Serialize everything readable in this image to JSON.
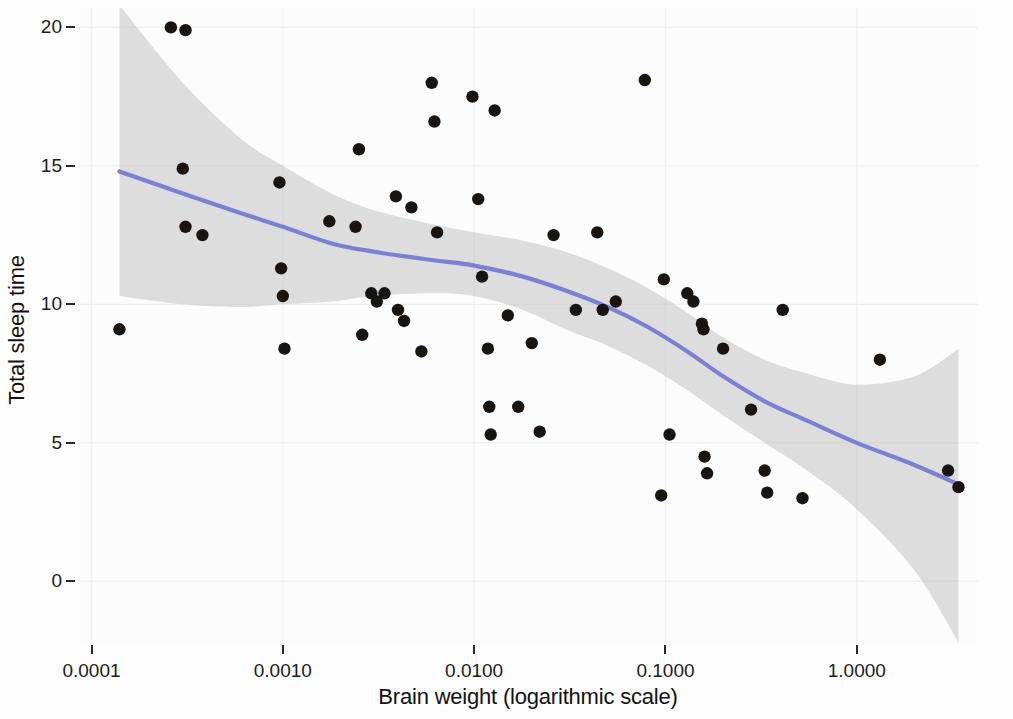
{
  "chart_data": {
    "type": "scatter",
    "title": "",
    "subtitle": "",
    "xlabel": "Brain weight (logarithmic scale)",
    "ylabel": "Total sleep time",
    "x_scale": "log10",
    "xtick_labels": [
      "0.0001",
      "0.0010",
      "0.0100",
      "0.1000",
      "1.0000"
    ],
    "xtick_values": [
      0.0001,
      0.001,
      0.01,
      0.1,
      1.0
    ],
    "ytick_labels": [
      "0",
      "5",
      "10",
      "15",
      "20"
    ],
    "ytick_values": [
      0,
      5,
      10,
      15,
      20
    ],
    "xlim": [
      8.5e-05,
      4.3
    ],
    "ylim": [
      -2.3,
      20.7
    ],
    "grid": true,
    "legend": null,
    "accent_color": "#7b80d4",
    "point_color": "#1a1411",
    "ribbon_color": "#bfbfbf",
    "panel_color": "#fcfcfc",
    "series": [
      {
        "name": "Mammal observations",
        "type": "scatter",
        "points": [
          {
            "x": 0.00014,
            "y": 9.1
          },
          {
            "x": 0.00026,
            "y": 20.0
          },
          {
            "x": 0.00031,
            "y": 19.9
          },
          {
            "x": 0.0003,
            "y": 14.9
          },
          {
            "x": 0.00031,
            "y": 12.8
          },
          {
            "x": 0.00038,
            "y": 12.5
          },
          {
            "x": 0.00096,
            "y": 14.4
          },
          {
            "x": 0.00098,
            "y": 11.3
          },
          {
            "x": 0.001,
            "y": 10.3
          },
          {
            "x": 0.00102,
            "y": 8.4
          },
          {
            "x": 0.00175,
            "y": 13.0
          },
          {
            "x": 0.0025,
            "y": 15.6
          },
          {
            "x": 0.0024,
            "y": 12.8
          },
          {
            "x": 0.0026,
            "y": 8.9
          },
          {
            "x": 0.0029,
            "y": 10.4
          },
          {
            "x": 0.0031,
            "y": 10.1
          },
          {
            "x": 0.0034,
            "y": 10.4
          },
          {
            "x": 0.0039,
            "y": 13.9
          },
          {
            "x": 0.004,
            "y": 9.8
          },
          {
            "x": 0.0043,
            "y": 9.4
          },
          {
            "x": 0.0047,
            "y": 13.5
          },
          {
            "x": 0.0053,
            "y": 8.3
          },
          {
            "x": 0.006,
            "y": 18.0
          },
          {
            "x": 0.0062,
            "y": 16.6
          },
          {
            "x": 0.0064,
            "y": 12.6
          },
          {
            "x": 0.0098,
            "y": 17.5
          },
          {
            "x": 0.0105,
            "y": 13.8
          },
          {
            "x": 0.011,
            "y": 11.0
          },
          {
            "x": 0.0118,
            "y": 8.4
          },
          {
            "x": 0.012,
            "y": 6.3
          },
          {
            "x": 0.0122,
            "y": 5.3
          },
          {
            "x": 0.0128,
            "y": 17.0
          },
          {
            "x": 0.015,
            "y": 9.6
          },
          {
            "x": 0.017,
            "y": 6.3
          },
          {
            "x": 0.02,
            "y": 8.6
          },
          {
            "x": 0.022,
            "y": 5.4
          },
          {
            "x": 0.026,
            "y": 12.5
          },
          {
            "x": 0.034,
            "y": 9.8
          },
          {
            "x": 0.044,
            "y": 12.6
          },
          {
            "x": 0.047,
            "y": 9.8
          },
          {
            "x": 0.055,
            "y": 10.1
          },
          {
            "x": 0.078,
            "y": 18.1
          },
          {
            "x": 0.095,
            "y": 3.1
          },
          {
            "x": 0.098,
            "y": 10.9
          },
          {
            "x": 0.105,
            "y": 5.3
          },
          {
            "x": 0.13,
            "y": 10.4
          },
          {
            "x": 0.14,
            "y": 10.1
          },
          {
            "x": 0.155,
            "y": 9.3
          },
          {
            "x": 0.158,
            "y": 9.1
          },
          {
            "x": 0.16,
            "y": 4.5
          },
          {
            "x": 0.165,
            "y": 3.9
          },
          {
            "x": 0.2,
            "y": 8.4
          },
          {
            "x": 0.28,
            "y": 6.2
          },
          {
            "x": 0.33,
            "y": 4.0
          },
          {
            "x": 0.34,
            "y": 3.2
          },
          {
            "x": 0.41,
            "y": 9.8
          },
          {
            "x": 0.52,
            "y": 3.0
          },
          {
            "x": 1.32,
            "y": 8.0
          },
          {
            "x": 3.0,
            "y": 4.0
          },
          {
            "x": 3.4,
            "y": 3.4
          }
        ]
      },
      {
        "name": "LOESS smooth",
        "type": "line",
        "color": "#7b80d4",
        "points": [
          {
            "x": 0.00014,
            "y": 14.8
          },
          {
            "x": 0.0003,
            "y": 14.0
          },
          {
            "x": 0.0006,
            "y": 13.3
          },
          {
            "x": 0.001,
            "y": 12.8
          },
          {
            "x": 0.0018,
            "y": 12.2
          },
          {
            "x": 0.003,
            "y": 11.9
          },
          {
            "x": 0.006,
            "y": 11.6
          },
          {
            "x": 0.01,
            "y": 11.4
          },
          {
            "x": 0.018,
            "y": 11.0
          },
          {
            "x": 0.03,
            "y": 10.5
          },
          {
            "x": 0.05,
            "y": 9.9
          },
          {
            "x": 0.08,
            "y": 9.2
          },
          {
            "x": 0.13,
            "y": 8.3
          },
          {
            "x": 0.2,
            "y": 7.4
          },
          {
            "x": 0.33,
            "y": 6.5
          },
          {
            "x": 0.55,
            "y": 5.8
          },
          {
            "x": 1.0,
            "y": 5.0
          },
          {
            "x": 2.0,
            "y": 4.2
          },
          {
            "x": 3.4,
            "y": 3.5
          }
        ]
      },
      {
        "name": "Confidence band",
        "type": "ribbon",
        "upper": [
          {
            "x": 0.00014,
            "y": 20.8
          },
          {
            "x": 0.0003,
            "y": 18.0
          },
          {
            "x": 0.0006,
            "y": 16.0
          },
          {
            "x": 0.001,
            "y": 15.0
          },
          {
            "x": 0.0018,
            "y": 14.0
          },
          {
            "x": 0.003,
            "y": 13.4
          },
          {
            "x": 0.006,
            "y": 12.9
          },
          {
            "x": 0.01,
            "y": 12.6
          },
          {
            "x": 0.018,
            "y": 12.3
          },
          {
            "x": 0.03,
            "y": 11.9
          },
          {
            "x": 0.05,
            "y": 11.3
          },
          {
            "x": 0.08,
            "y": 10.6
          },
          {
            "x": 0.13,
            "y": 9.7
          },
          {
            "x": 0.2,
            "y": 8.8
          },
          {
            "x": 0.33,
            "y": 8.0
          },
          {
            "x": 0.55,
            "y": 7.5
          },
          {
            "x": 1.0,
            "y": 7.1
          },
          {
            "x": 2.0,
            "y": 7.4
          },
          {
            "x": 3.4,
            "y": 8.4
          }
        ],
        "lower": [
          {
            "x": 0.00014,
            "y": 10.3
          },
          {
            "x": 0.0003,
            "y": 10.0
          },
          {
            "x": 0.0006,
            "y": 9.9
          },
          {
            "x": 0.001,
            "y": 10.0
          },
          {
            "x": 0.0018,
            "y": 10.1
          },
          {
            "x": 0.003,
            "y": 10.3
          },
          {
            "x": 0.006,
            "y": 10.4
          },
          {
            "x": 0.01,
            "y": 10.3
          },
          {
            "x": 0.018,
            "y": 9.8
          },
          {
            "x": 0.03,
            "y": 9.1
          },
          {
            "x": 0.05,
            "y": 8.5
          },
          {
            "x": 0.08,
            "y": 7.8
          },
          {
            "x": 0.13,
            "y": 6.9
          },
          {
            "x": 0.2,
            "y": 6.0
          },
          {
            "x": 0.33,
            "y": 5.0
          },
          {
            "x": 0.55,
            "y": 4.0
          },
          {
            "x": 1.0,
            "y": 2.6
          },
          {
            "x": 2.0,
            "y": 0.4
          },
          {
            "x": 3.4,
            "y": -2.2
          }
        ]
      }
    ]
  }
}
